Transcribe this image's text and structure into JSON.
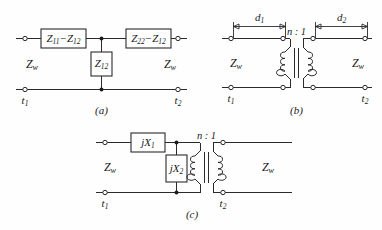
{
  "figure": {
    "background_color": "#fefefe",
    "line_color": "#2b2b2b",
    "text_color": "#1a1a1a"
  },
  "circuits": [
    {
      "id": "a",
      "caption": "(a)",
      "type": "tee-network",
      "series_left": {
        "label_main": "Z",
        "sub1": "11",
        "minus": "−",
        "label_second": "Z",
        "sub2": "12",
        "text": "Z11 − Z12"
      },
      "series_right": {
        "label_main": "Z",
        "sub1": "22",
        "minus": "−",
        "label_second": "Z",
        "sub2": "12",
        "text": "Z22 − Z12"
      },
      "shunt": {
        "label_main": "Z",
        "sub1": "12",
        "text": "Z12"
      },
      "impedance_left": {
        "label_main": "Z",
        "sub1": "w",
        "text": "Zw"
      },
      "impedance_right": {
        "label_main": "Z",
        "sub1": "w",
        "text": "Zw"
      },
      "terminal_left": {
        "label_main": "t",
        "sub1": "1",
        "text": "t1"
      },
      "terminal_right": {
        "label_main": "t",
        "sub1": "2",
        "text": "t2"
      }
    },
    {
      "id": "b",
      "caption": "(b)",
      "type": "transformer-with-line-lengths",
      "dimension_left": {
        "label_main": "d",
        "sub1": "1",
        "text": "d1"
      },
      "dimension_right": {
        "label_main": "d",
        "sub1": "2",
        "text": "d2"
      },
      "turns_ratio": "n : 1",
      "impedance_left": {
        "label_main": "Z",
        "sub1": "w",
        "text": "Zw"
      },
      "impedance_right": {
        "label_main": "Z",
        "sub1": "w",
        "text": "Zw"
      },
      "terminal_left": {
        "label_main": "t",
        "sub1": "1",
        "text": "t1"
      },
      "terminal_right": {
        "label_main": "t",
        "sub1": "2",
        "text": "t2"
      }
    },
    {
      "id": "c",
      "caption": "(c)",
      "type": "reactance-l-network-with-transformer",
      "series_reactance": {
        "label_main": "jX",
        "sub1": "1",
        "text": "jX1"
      },
      "shunt_reactance": {
        "label_main": "jX",
        "sub1": "2",
        "text": "jX2"
      },
      "turns_ratio": "n : 1",
      "impedance_left": {
        "label_main": "Z",
        "sub1": "w",
        "text": "Zw"
      },
      "impedance_right": {
        "label_main": "Z",
        "sub1": "w",
        "text": "Zw"
      },
      "terminal_left": {
        "label_main": "t",
        "sub1": "1",
        "text": "t1"
      },
      "terminal_right": {
        "label_main": "t",
        "sub1": "2",
        "text": "t2"
      }
    }
  ]
}
